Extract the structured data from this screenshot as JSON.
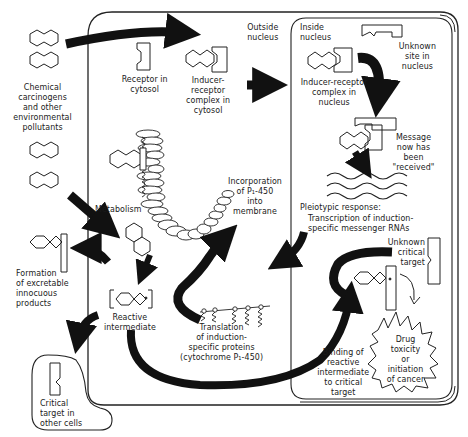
{
  "diagram": {
    "type": "biological-pathway"
  },
  "regions": {
    "cell": {
      "label": "cell (cytosol)"
    },
    "nucleus": {
      "label": "nucleus"
    }
  },
  "labels": {
    "chemical_carcinogens": "Chemical\ncarcinogens\nand other\nenvironmental\npollutants",
    "receptor_cytosol": "Receptor in\ncytosol",
    "inducer_receptor_cytosol": "Inducer-\nreceptor\ncomplex in\ncytosol",
    "outside_nucleus": "Outside\nnucleus",
    "inside_nucleus": "Inside\nnucleus",
    "unknown_site": "Unknown\nsite in\nnucleus",
    "inducer_receptor_nucleus": "Inducer-receptor\ncomplex in\nnucleus",
    "message_received": "Message\nnow has\nbeen\n\"received\"",
    "incorporation": "Incorporation\nof P₁-450\ninto\nmembrane",
    "metabolism": "Metabolism",
    "pleiotypic": "Pleiotypic response:",
    "transcription": "Transcription of induction-\nspecific messenger RNAs",
    "unknown_critical_target": "Unknown\ncritical\ntarget",
    "formation_excretable": "Formation\nof excretable\ninnocuous\nproducts",
    "reactive_intermediate": "Reactive\nintermediate",
    "translation": "Translation\nof induction-\nspecific proteins\n(cytochrome P₁-450)",
    "binding_reactive": "Binding of\nreactive\nintermediate\nto critical\ntarget",
    "drug_toxicity": "Drug\ntoxicity\nor\ninitiation\nof cancer",
    "critical_target_other": "Critical\ntarget in\nother cells"
  },
  "colors": {
    "ink": "#111111",
    "background": "#ffffff"
  }
}
